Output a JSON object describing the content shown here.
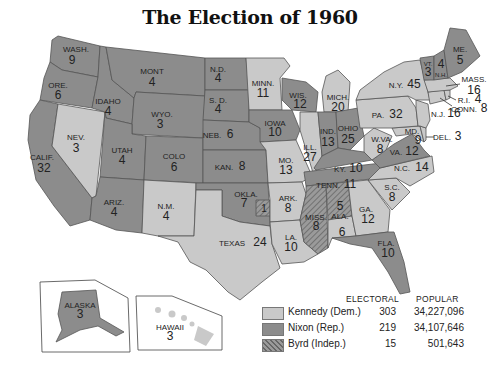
{
  "title": "The Election of 1960",
  "colors": {
    "kennedy": "#c9c9c9",
    "nixon": "#8c8c8c",
    "byrd": "#7a7a7a",
    "border": "#555555",
    "water": "#ffffff"
  },
  "legend": {
    "electoral_header": "ELECTORAL",
    "popular_header": "POPULAR",
    "entries": [
      {
        "name": "Kennedy (Dem.)",
        "electoral": "303",
        "popular": "34,227,096",
        "swatch": "kennedy"
      },
      {
        "name": "Nixon (Rep.)",
        "electoral": "219",
        "popular": "34,107,646",
        "swatch": "nixon"
      },
      {
        "name": "Byrd (Indep.)",
        "electoral": "15",
        "popular": "501,643",
        "swatch": "byrd"
      }
    ]
  },
  "states": {
    "wash": {
      "label": "WASH.",
      "votes": "9",
      "winner": "nixon"
    },
    "ore": {
      "label": "ORE.",
      "votes": "6",
      "winner": "nixon"
    },
    "calif": {
      "label": "CALIF.",
      "votes": "32",
      "winner": "nixon"
    },
    "nev": {
      "label": "NEV.",
      "votes": "3",
      "winner": "kennedy"
    },
    "idaho": {
      "label": "IDAHO",
      "votes": "4",
      "winner": "nixon"
    },
    "mont": {
      "label": "MONT",
      "votes": "4",
      "winner": "nixon"
    },
    "wyo": {
      "label": "WYO.",
      "votes": "3",
      "winner": "nixon"
    },
    "utah": {
      "label": "UTAH",
      "votes": "4",
      "winner": "nixon"
    },
    "ariz": {
      "label": "ARIZ.",
      "votes": "4",
      "winner": "nixon"
    },
    "colo": {
      "label": "COLO",
      "votes": "6",
      "winner": "nixon"
    },
    "nm": {
      "label": "N.M.",
      "votes": "4",
      "winner": "kennedy"
    },
    "nd": {
      "label": "N.D.",
      "votes": "4",
      "winner": "nixon"
    },
    "sd": {
      "label": "S. D.",
      "votes": "4",
      "winner": "nixon"
    },
    "neb": {
      "label": "NEB.",
      "votes": "6",
      "winner": "nixon"
    },
    "kan": {
      "label": "KAN.",
      "votes": "8",
      "winner": "nixon"
    },
    "okla": {
      "label": "OKLA.",
      "votes": "7",
      "winner": "nixon",
      "byrd_votes": "1"
    },
    "texas": {
      "label": "TEXAS",
      "votes": "24",
      "winner": "kennedy"
    },
    "minn": {
      "label": "MINN.",
      "votes": "11",
      "winner": "kennedy"
    },
    "iowa": {
      "label": "IOWA",
      "votes": "10",
      "winner": "nixon"
    },
    "mo": {
      "label": "MO.",
      "votes": "13",
      "winner": "kennedy"
    },
    "ark": {
      "label": "ARK.",
      "votes": "8",
      "winner": "kennedy"
    },
    "la": {
      "label": "LA.",
      "votes": "10",
      "winner": "kennedy"
    },
    "wis": {
      "label": "WIS.",
      "votes": "12",
      "winner": "nixon"
    },
    "ill": {
      "label": "ILL.",
      "votes": "27",
      "winner": "kennedy"
    },
    "mich": {
      "label": "MICH.",
      "votes": "20",
      "winner": "kennedy"
    },
    "ind": {
      "label": "IND.",
      "votes": "13",
      "winner": "nixon"
    },
    "ohio": {
      "label": "OHIO",
      "votes": "25",
      "winner": "nixon"
    },
    "ky": {
      "label": "KY.",
      "votes": "10",
      "winner": "nixon"
    },
    "tenn": {
      "label": "TENN.",
      "votes": "11",
      "winner": "nixon"
    },
    "miss": {
      "label": "MISS.",
      "votes": "8",
      "winner": "byrd"
    },
    "ala": {
      "label": "ALA.",
      "votes": "6",
      "winner": "kennedy",
      "byrd_votes": "5"
    },
    "ga": {
      "label": "GA.",
      "votes": "12",
      "winner": "kennedy"
    },
    "fla": {
      "label": "FLA.",
      "votes": "10",
      "winner": "nixon"
    },
    "sc": {
      "label": "S.C.",
      "votes": "8",
      "winner": "kennedy"
    },
    "nc": {
      "label": "N.C.",
      "votes": "14",
      "winner": "kennedy"
    },
    "va": {
      "label": "VA.",
      "votes": "12",
      "winner": "nixon"
    },
    "wva": {
      "label": "W.VA.",
      "votes": "8",
      "winner": "kennedy"
    },
    "md": {
      "label": "MD.",
      "votes": "9",
      "winner": "kennedy"
    },
    "del": {
      "label": "DEL.",
      "votes": "3",
      "winner": "kennedy"
    },
    "nj": {
      "label": "N.J.",
      "votes": "16",
      "winner": "kennedy"
    },
    "pa": {
      "label": "PA.",
      "votes": "32",
      "winner": "kennedy"
    },
    "ny": {
      "label": "N.Y.",
      "votes": "45",
      "winner": "kennedy"
    },
    "conn": {
      "label": "CONN.",
      "votes": "8",
      "winner": "kennedy"
    },
    "ri": {
      "label": "R.I.",
      "votes": "4",
      "winner": "kennedy"
    },
    "mass": {
      "label": "MASS.",
      "votes": "16",
      "winner": "kennedy"
    },
    "vt": {
      "label": "VT.",
      "votes": "3",
      "winner": "nixon"
    },
    "nh": {
      "label": "N.H.",
      "votes": "4",
      "winner": "nixon"
    },
    "me": {
      "label": "ME.",
      "votes": "5",
      "winner": "nixon"
    },
    "alaska": {
      "label": "ALASKA",
      "votes": "3",
      "winner": "nixon"
    },
    "hawaii": {
      "label": "HAWAII",
      "votes": "3",
      "winner": "kennedy"
    }
  }
}
